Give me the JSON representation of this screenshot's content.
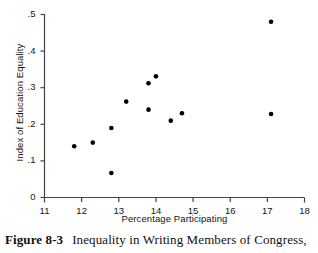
{
  "figure": {
    "caption_label": "Figure 8-3",
    "caption_text": "Inequality in Writing Members of Congress,"
  },
  "chart_data": {
    "type": "scatter",
    "title": "",
    "xlabel": "Percentage Participating",
    "ylabel": "Index of Education Equality",
    "xlim": [
      11,
      18
    ],
    "ylim": [
      0,
      0.5
    ],
    "xticks": [
      "11",
      "12",
      "13",
      "14",
      "15",
      "16",
      "17",
      "18"
    ],
    "xtick_values": [
      11,
      12,
      13,
      14,
      15,
      16,
      17,
      18
    ],
    "yticks": [
      "0",
      ".1",
      ".2",
      ".3",
      ".4",
      ".5"
    ],
    "ytick_values": [
      0,
      0.1,
      0.2,
      0.3,
      0.4,
      0.5
    ],
    "grid": false,
    "legend": null,
    "marker": {
      "shape": "circle",
      "color": "#000000",
      "size_px": 4.6
    },
    "points": [
      {
        "x": 11.8,
        "y": 0.14
      },
      {
        "x": 12.3,
        "y": 0.15
      },
      {
        "x": 12.8,
        "y": 0.19
      },
      {
        "x": 12.8,
        "y": 0.067
      },
      {
        "x": 13.2,
        "y": 0.262
      },
      {
        "x": 13.8,
        "y": 0.312
      },
      {
        "x": 13.8,
        "y": 0.24
      },
      {
        "x": 14.0,
        "y": 0.331
      },
      {
        "x": 14.4,
        "y": 0.21
      },
      {
        "x": 14.7,
        "y": 0.23
      },
      {
        "x": 17.1,
        "y": 0.48
      },
      {
        "x": 17.1,
        "y": 0.228
      }
    ],
    "axis_style": {
      "line_color": "#444444",
      "line_width": 1.2,
      "tick_length": 4,
      "tick_direction": "in-out",
      "spines": [
        "left",
        "bottom"
      ]
    }
  }
}
